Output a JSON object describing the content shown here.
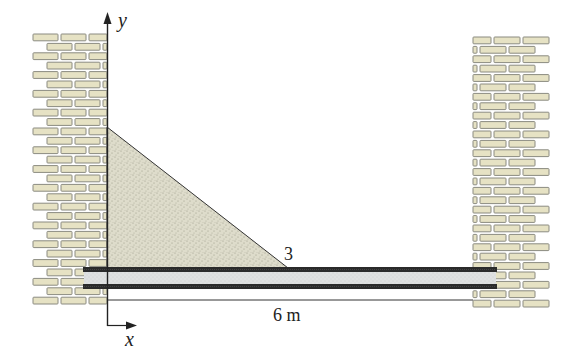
{
  "figure": {
    "axes": {
      "y_label": "y",
      "x_label": "x"
    },
    "load": {
      "shape": "triangular distributed load",
      "peak_label": "3"
    },
    "beam": {
      "span_label": "6 m"
    },
    "walls": {
      "left": "brick wall",
      "right": "brick wall"
    }
  },
  "colors": {
    "brick_fill": "#e6e2c4",
    "brick_stroke": "#8a8a80",
    "load_fill": "#dcdcc8",
    "beam_flange": "#2b2b2b",
    "beam_web": "#e0e2e2",
    "line": "#222222"
  }
}
